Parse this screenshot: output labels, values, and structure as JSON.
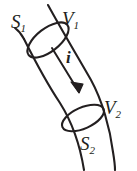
{
  "figure": {
    "type": "line-diagram",
    "canvas": {
      "width": 137,
      "height": 171
    },
    "background_color": "#ffffff",
    "stroke_color": "#231f20",
    "labels": {
      "s1": {
        "base": "S",
        "sub": "1",
        "x": 11,
        "y": 12
      },
      "v1": {
        "base": "V",
        "sub": "1",
        "x": 62,
        "y": 9
      },
      "v2": {
        "base": "V",
        "sub": "2",
        "x": 104,
        "y": 98
      },
      "s2": {
        "base": "S",
        "sub": "2",
        "x": 80,
        "y": 134
      },
      "current": {
        "base": "i",
        "sub": "",
        "x": 66,
        "y": 49
      }
    },
    "elements": [
      {
        "name": "tube-left-wall",
        "kind": "curve"
      },
      {
        "name": "tube-right-wall",
        "kind": "curve"
      },
      {
        "name": "cross-section-upper",
        "kind": "ellipse"
      },
      {
        "name": "cross-section-lower",
        "kind": "ellipse"
      },
      {
        "name": "flow-arrow",
        "kind": "arrow",
        "direction": "down-right"
      }
    ]
  }
}
